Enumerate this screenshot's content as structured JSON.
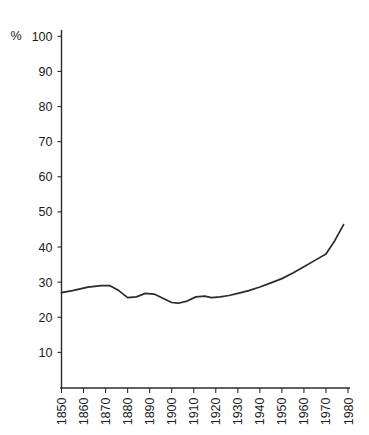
{
  "chart_data": {
    "type": "line",
    "title": "",
    "xlabel": "",
    "ylabel": "",
    "unit_label": "%",
    "xlim": [
      1850,
      1980
    ],
    "ylim": [
      0,
      105
    ],
    "grid": false,
    "legend": "none",
    "line_color": "#2b2b2b",
    "axis_color": "#2b2b2b",
    "background": "#ffffff",
    "x_ticks": [
      1850,
      1860,
      1870,
      1880,
      1890,
      1900,
      1910,
      1920,
      1930,
      1940,
      1950,
      1960,
      1970,
      1980
    ],
    "x_tick_labels": [
      "1850",
      "1860",
      "1870",
      "1880",
      "1890",
      "1900",
      "1910",
      "1920",
      "1930",
      "1940",
      "1950",
      "1960",
      "1970",
      "1980"
    ],
    "x_tick_rotation": -90,
    "y_ticks": [
      10,
      20,
      30,
      40,
      50,
      60,
      70,
      80,
      90,
      100
    ],
    "y_tick_labels": [
      "10",
      "20",
      "30",
      "40",
      "50",
      "60",
      "70",
      "80",
      "90",
      "100"
    ],
    "series": [
      {
        "name": "series-1",
        "color": "#2b2b2b",
        "x": [
          1850,
          1855,
          1862,
          1868,
          1872,
          1876,
          1880,
          1884,
          1888,
          1892,
          1896,
          1900,
          1903,
          1907,
          1911,
          1915,
          1918,
          1922,
          1926,
          1930,
          1935,
          1940,
          1945,
          1950,
          1955,
          1960,
          1965,
          1970,
          1974,
          1978
        ],
        "y": [
          27.0,
          27.6,
          28.6,
          29.0,
          29.0,
          27.6,
          25.6,
          25.8,
          26.8,
          26.6,
          25.4,
          24.2,
          24.0,
          24.6,
          25.8,
          26.0,
          25.6,
          25.8,
          26.2,
          26.8,
          27.6,
          28.6,
          29.8,
          31.0,
          32.6,
          34.4,
          36.2,
          38.0,
          41.8,
          46.4
        ]
      }
    ]
  },
  "axes": {
    "y_unit": "%"
  }
}
